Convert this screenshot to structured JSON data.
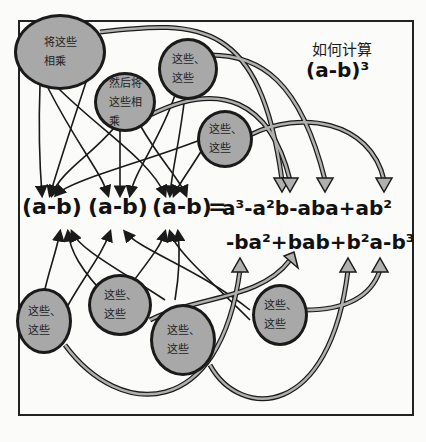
{
  "title": {
    "question": "如何计算",
    "formula": "(a-b)³"
  },
  "equation": {
    "factors": [
      "(a-b)",
      "(a-b)",
      "(a-b)"
    ],
    "equals": "=",
    "line1": "a³-a²b-aba+ab²",
    "line2": "-ba²+bab+b²a-b³"
  },
  "bubbles": [
    {
      "id": "top-left",
      "text": "将这些\n相乘"
    },
    {
      "id": "top-middle",
      "text": "然后将\n这些相\n乘"
    },
    {
      "id": "top-right-1",
      "text": "这些、\n这些"
    },
    {
      "id": "top-right-2",
      "text": "这些、\n这些"
    },
    {
      "id": "bottom-1",
      "text": "这些、\n这些"
    },
    {
      "id": "bottom-2",
      "text": "这些、\n这些"
    },
    {
      "id": "bottom-3",
      "text": "这些、\n这些"
    },
    {
      "id": "bottom-4",
      "text": "这些、\n这些"
    }
  ],
  "colors": {
    "bubble_fill": "#a8a8a8",
    "line": "#1a1a1a",
    "arrow_fill": "#b0b0b0",
    "background": "#fbfbf9"
  }
}
